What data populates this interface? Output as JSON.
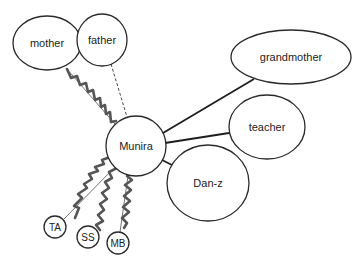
{
  "diagram": {
    "type": "social-network",
    "center": "Munira",
    "nodes": [
      {
        "id": "mother",
        "label": "mother"
      },
      {
        "id": "father",
        "label": "father"
      },
      {
        "id": "grandmother",
        "label": "grandmother"
      },
      {
        "id": "teacher",
        "label": "teacher"
      },
      {
        "id": "munira",
        "label": "Munira"
      },
      {
        "id": "danz",
        "label": "Dan-z"
      },
      {
        "id": "ta",
        "label": "TA"
      },
      {
        "id": "ss",
        "label": "SS"
      },
      {
        "id": "mb",
        "label": "MB"
      }
    ],
    "edges": [
      {
        "from": "Munira",
        "to": "mother",
        "style": "conflict (wavy) + thin"
      },
      {
        "from": "Munira",
        "to": "father",
        "style": "dashed"
      },
      {
        "from": "Munira",
        "to": "grandmother",
        "style": "strong (solid)"
      },
      {
        "from": "Munira",
        "to": "teacher",
        "style": "strong (solid)"
      },
      {
        "from": "Munira",
        "to": "Dan-z",
        "style": "strong (solid)"
      },
      {
        "from": "Munira",
        "to": "TA",
        "style": "conflict (wavy) + thin"
      },
      {
        "from": "Munira",
        "to": "SS",
        "style": "conflict (wavy)"
      },
      {
        "from": "Munira",
        "to": "MB",
        "style": "conflict (wavy) + thin"
      }
    ],
    "colors": {
      "stroke": "#2a2a2a",
      "wavy": "#555555",
      "background": "#ffffff"
    }
  }
}
